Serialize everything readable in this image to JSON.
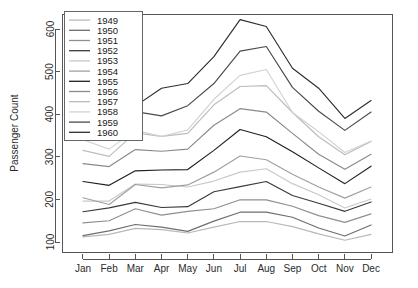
{
  "chart_data": {
    "type": "line",
    "title": "",
    "xlabel": "",
    "ylabel": "Passenger Count",
    "categories": [
      "Jan",
      "Feb",
      "Mar",
      "Apr",
      "May",
      "Jun",
      "Jul",
      "Aug",
      "Sep",
      "Oct",
      "Nov",
      "Dec"
    ],
    "ylim": [
      100,
      640
    ],
    "xlim_categories": 12,
    "yticks": [
      100,
      200,
      300,
      400,
      500,
      600
    ],
    "ytick_labels": [
      "100",
      "200",
      "300",
      "400",
      "500",
      "600"
    ],
    "grid": false,
    "legend_position": "top-left",
    "legend_title": "",
    "series": [
      {
        "name": "1949",
        "color": "#b8b8b8",
        "values": [
          112,
          118,
          132,
          129,
          121,
          135,
          148,
          148,
          136,
          119,
          104,
          118
        ]
      },
      {
        "name": "1950",
        "color": "#6e6e6e",
        "values": [
          115,
          126,
          141,
          135,
          125,
          149,
          170,
          170,
          158,
          133,
          114,
          140
        ]
      },
      {
        "name": "1951",
        "color": "#8f8f8f",
        "values": [
          145,
          150,
          178,
          163,
          172,
          178,
          199,
          199,
          184,
          162,
          146,
          166
        ]
      },
      {
        "name": "1952",
        "color": "#3a3a3a",
        "values": [
          171,
          180,
          193,
          181,
          183,
          218,
          230,
          242,
          209,
          191,
          172,
          194
        ]
      },
      {
        "name": "1953",
        "color": "#c9c9c9",
        "values": [
          196,
          196,
          236,
          235,
          229,
          243,
          264,
          272,
          237,
          211,
          180,
          201
        ]
      },
      {
        "name": "1954",
        "color": "#a0a0a0",
        "values": [
          204,
          188,
          235,
          227,
          234,
          264,
          302,
          293,
          259,
          229,
          203,
          229
        ]
      },
      {
        "name": "1955",
        "color": "#1f1f1f",
        "values": [
          242,
          233,
          267,
          269,
          270,
          315,
          364,
          347,
          312,
          274,
          237,
          278
        ]
      },
      {
        "name": "1956",
        "color": "#8a8a8a",
        "values": [
          284,
          277,
          317,
          313,
          318,
          374,
          413,
          405,
          355,
          306,
          271,
          306
        ]
      },
      {
        "name": "1957",
        "color": "#bcbcbc",
        "values": [
          315,
          301,
          356,
          348,
          355,
          422,
          465,
          467,
          404,
          347,
          305,
          336
        ]
      },
      {
        "name": "1958",
        "color": "#d2d2d2",
        "values": [
          340,
          318,
          362,
          348,
          363,
          435,
          491,
          505,
          404,
          359,
          310,
          337
        ]
      },
      {
        "name": "1959",
        "color": "#4a4a4a",
        "values": [
          360,
          342,
          406,
          396,
          420,
          472,
          548,
          559,
          463,
          407,
          362,
          405
        ]
      },
      {
        "name": "1960",
        "color": "#2e2e2e",
        "values": [
          417,
          391,
          419,
          461,
          472,
          535,
          622,
          606,
          508,
          461,
          390,
          432
        ]
      }
    ]
  },
  "axes": {
    "y_title": "Passenger Count"
  }
}
